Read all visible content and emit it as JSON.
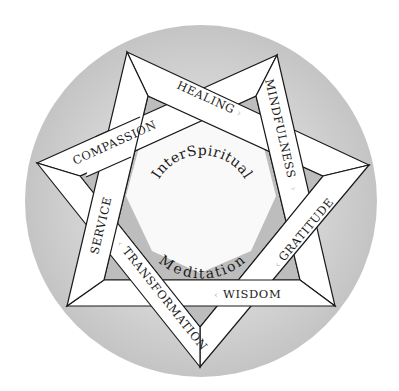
{
  "center": {
    "line1": "InterSpiritual",
    "line2": "Meditation"
  },
  "colors": {
    "background": "#ffffff",
    "disc": "#c9c9c9",
    "disc_center": "#f7f7f7",
    "band_fill": "#ffffff",
    "band_stroke": "#1a1a1a",
    "inner_notch": "#bdbdbd",
    "arrow": "#b8b8b8"
  },
  "bands": [
    {
      "id": "healing",
      "label": "HEALING",
      "arrow": "›"
    },
    {
      "id": "mindfulness",
      "label": "MINDFULNESS",
      "arrow": "›"
    },
    {
      "id": "gratitude",
      "label": "GRATITUDE",
      "arrow": "‹"
    },
    {
      "id": "wisdom",
      "label": "WISDOM",
      "arrow": "‹"
    },
    {
      "id": "transformation",
      "label": "TRANSFORMATION",
      "arrow": "‹"
    },
    {
      "id": "service",
      "label": "SERVICE",
      "arrow": "›"
    },
    {
      "id": "compassion",
      "label": "COMPASSION",
      "arrow": "›"
    }
  ]
}
